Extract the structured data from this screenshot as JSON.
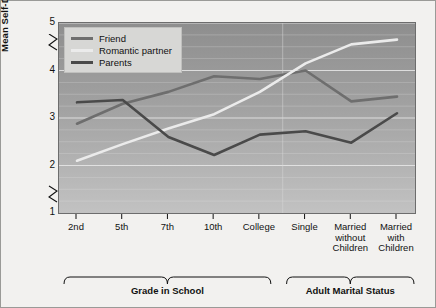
{
  "chart_data": {
    "type": "line",
    "title": "",
    "xlabel": "",
    "ylabel": "Mean Self-Disclosure Score",
    "ylim": [
      1,
      5
    ],
    "yticks": [
      1,
      2,
      3,
      4,
      5
    ],
    "axis_break": true,
    "grid": true,
    "legend_position": "top-left",
    "categories": [
      "2nd",
      "5th",
      "7th",
      "10th",
      "College",
      "Single",
      "Married without Children",
      "Married with Children"
    ],
    "groups": [
      {
        "label": "Grade in School",
        "categories": [
          "2nd",
          "5th",
          "7th",
          "10th",
          "College"
        ]
      },
      {
        "label": "Adult Marital Status",
        "categories": [
          "Single",
          "Married without Children",
          "Married with Children"
        ]
      }
    ],
    "series": [
      {
        "name": "Friend",
        "color": "#6e6e6e",
        "values": [
          2.88,
          3.3,
          3.55,
          3.88,
          3.82,
          4.0,
          3.35,
          3.45
        ]
      },
      {
        "name": "Romantic partner",
        "color": "#ebebeb",
        "values": [
          2.1,
          2.45,
          2.78,
          3.08,
          3.55,
          4.15,
          4.55,
          4.65
        ]
      },
      {
        "name": "Parents",
        "color": "#4a4a4a",
        "values": [
          3.33,
          3.38,
          2.6,
          2.22,
          2.65,
          2.72,
          2.48,
          3.1
        ]
      }
    ]
  },
  "yaxis": {
    "label": "Mean Self-Disclosure Score",
    "ticks": [
      "5",
      "4",
      "3",
      "2",
      "1"
    ]
  },
  "xaxis": {
    "ticks": [
      {
        "lines": [
          "2nd"
        ]
      },
      {
        "lines": [
          "5th"
        ]
      },
      {
        "lines": [
          "7th"
        ]
      },
      {
        "lines": [
          "10th"
        ]
      },
      {
        "lines": [
          "College"
        ]
      },
      {
        "lines": [
          "Single"
        ]
      },
      {
        "lines": [
          "Married",
          "without",
          "Children"
        ]
      },
      {
        "lines": [
          "Married",
          "with",
          "Children"
        ]
      }
    ]
  },
  "groups": [
    {
      "label": "Grade in School"
    },
    {
      "label": "Adult Marital Status"
    }
  ],
  "legend": {
    "items": [
      {
        "label": "Friend",
        "color": "#6e6e6e"
      },
      {
        "label": "Romantic partner",
        "color": "#ebebeb"
      },
      {
        "label": "Parents",
        "color": "#4a4a4a"
      }
    ]
  }
}
